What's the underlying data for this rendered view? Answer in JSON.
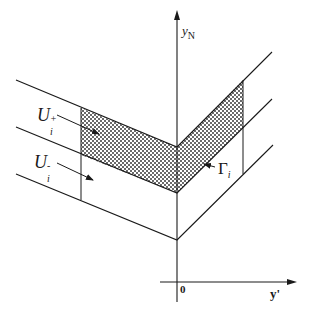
{
  "figure": {
    "axes": {
      "vertical_label_main": "y",
      "vertical_label_sub": "N",
      "horizontal_label": "y'",
      "origin_label": "0"
    },
    "regions": {
      "upper_label_main": "U",
      "upper_label_sub": "i",
      "upper_label_sup": "+",
      "lower_label_main": "U",
      "lower_label_sub": "i",
      "lower_label_sup": "-",
      "interface_label_main": "Γ",
      "interface_label_sub": "i"
    },
    "colors": {
      "line": "#1a1a1a",
      "hatch": "#555555",
      "background": "#ffffff"
    }
  }
}
